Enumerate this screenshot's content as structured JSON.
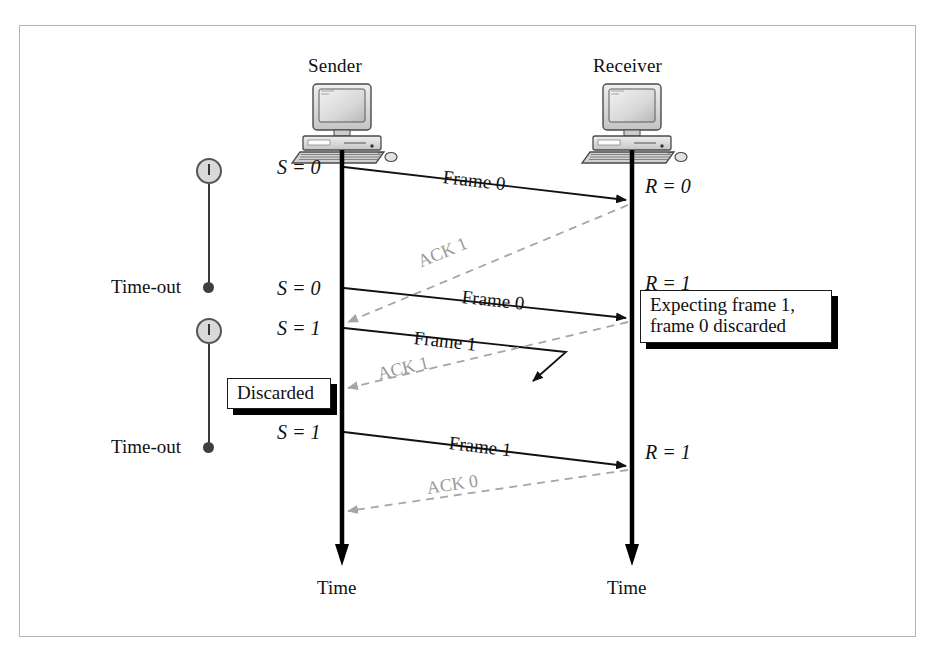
{
  "figure": {
    "type": "sequence-diagram"
  },
  "nodes": {
    "sender_label": "Sender",
    "receiver_label": "Receiver",
    "sender_time_label": "Time",
    "receiver_time_label": "Time"
  },
  "sender_states": [
    {
      "id": "s0-a",
      "text": "S = 0"
    },
    {
      "id": "s0-b",
      "text": "S = 0"
    },
    {
      "id": "s1-a",
      "text": "S = 1"
    },
    {
      "id": "s1-b",
      "text": "S = 1"
    }
  ],
  "receiver_states": [
    {
      "id": "r0",
      "text": "R = 0"
    },
    {
      "id": "r1-a",
      "text": "R = 1"
    },
    {
      "id": "r1-b",
      "text": "R = 1"
    }
  ],
  "frames": [
    {
      "id": "frame-0-first",
      "label": "Frame 0"
    },
    {
      "id": "frame-0-retransmit",
      "label": "Frame 0"
    },
    {
      "id": "frame-1-lost",
      "label": "Frame 1"
    },
    {
      "id": "frame-1-retransmit",
      "label": "Frame 1"
    }
  ],
  "acks": [
    {
      "id": "ack-1-lost",
      "label": "ACK 1"
    },
    {
      "id": "ack-1-second",
      "label": "ACK 1"
    },
    {
      "id": "ack-0",
      "label": "ACK 0"
    }
  ],
  "timeouts": [
    {
      "id": "timeout-1",
      "label": "Time-out"
    },
    {
      "id": "timeout-2",
      "label": "Time-out"
    }
  ],
  "callouts": {
    "expecting": {
      "line1": "Expecting frame 1,",
      "line2": "frame 0 discarded"
    },
    "discarded": {
      "line1": "Discarded"
    }
  },
  "colors": {
    "frame_line": "#111111",
    "ack_line": "#a6a6a6",
    "timeline": "#000000",
    "frame_border": "#b4b4b4",
    "clock_fill": "#d9d9d9",
    "callout_shadow": "#000000"
  }
}
